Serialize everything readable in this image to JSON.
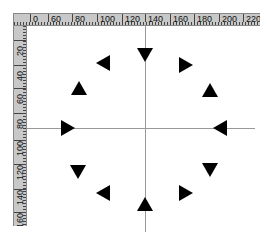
{
  "ruler_top": {
    "labels": [
      {
        "text": "0",
        "x": 16
      },
      {
        "text": "60",
        "x": 34
      },
      {
        "text": "80",
        "x": 58
      },
      {
        "text": "100",
        "x": 83
      },
      {
        "text": "120",
        "x": 108
      },
      {
        "text": "140",
        "x": 131
      },
      {
        "text": "160",
        "x": 156
      },
      {
        "text": "180",
        "x": 180
      },
      {
        "text": "200",
        "x": 205
      },
      {
        "text": "220",
        "x": 229
      }
    ]
  },
  "ruler_left": {
    "labels": [
      {
        "text": "20",
        "y": 14
      },
      {
        "text": "40",
        "y": 39
      },
      {
        "text": "60",
        "y": 62
      },
      {
        "text": "80",
        "y": 87
      },
      {
        "text": "100",
        "y": 114
      },
      {
        "text": "120",
        "y": 138
      },
      {
        "text": "140",
        "y": 163
      },
      {
        "text": "160",
        "y": 186
      },
      {
        "text": "180",
        "y": 210
      }
    ]
  },
  "guides": {
    "vertical_x": 145,
    "horizontal_y": 128
  },
  "triangles": [
    {
      "dir": "down",
      "x": 145,
      "y": 55
    },
    {
      "dir": "right",
      "x": 186,
      "y": 65
    },
    {
      "dir": "up",
      "x": 210,
      "y": 90
    },
    {
      "dir": "left",
      "x": 220,
      "y": 128
    },
    {
      "dir": "down",
      "x": 210,
      "y": 170
    },
    {
      "dir": "right",
      "x": 186,
      "y": 193
    },
    {
      "dir": "up",
      "x": 145,
      "y": 204
    },
    {
      "dir": "left",
      "x": 103,
      "y": 193
    },
    {
      "dir": "down",
      "x": 78,
      "y": 172
    },
    {
      "dir": "right",
      "x": 68,
      "y": 128
    },
    {
      "dir": "up",
      "x": 79,
      "y": 88
    },
    {
      "dir": "left",
      "x": 103,
      "y": 63
    }
  ]
}
